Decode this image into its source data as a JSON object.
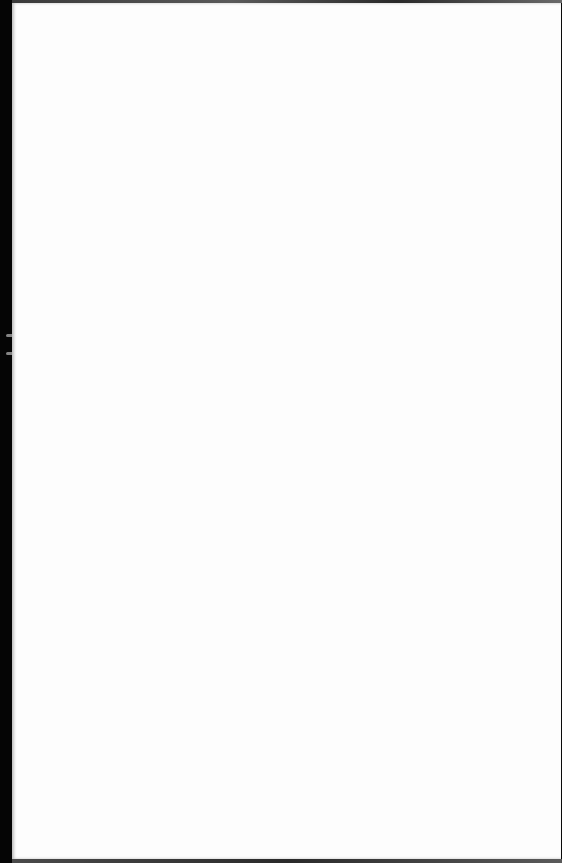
{
  "document": {
    "type": "scanned-page",
    "state": "blank",
    "text": "",
    "colors": {
      "paper": "#fdfdfd",
      "scanner_background": "#0a0a0a"
    }
  }
}
